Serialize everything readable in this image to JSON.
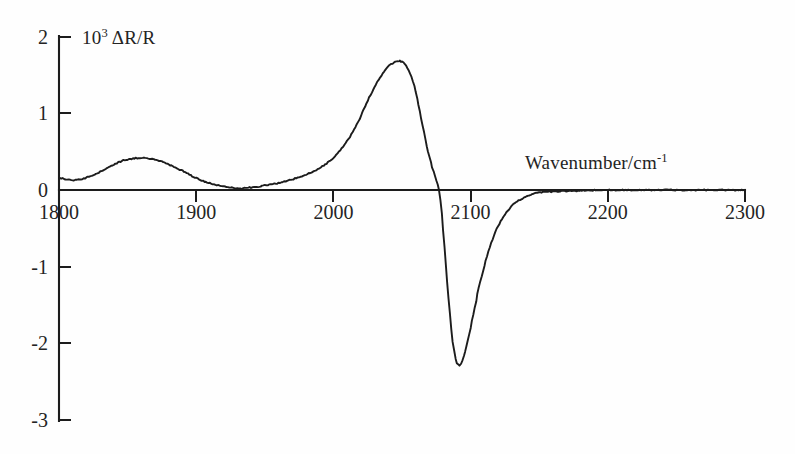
{
  "figure": {
    "background_color": "#fefefe",
    "line_color": "#1c1c1c",
    "axis_color": "#1c1c1c"
  },
  "axis_titles": {
    "y_prefix": "10",
    "y_exponent": "3",
    "y_suffix": " ΔR/R",
    "y_full": "10³ ΔR/R",
    "x_prefix": "Wavenumber/cm",
    "x_exponent": "-1",
    "x_full": "Wavenumber/cm⁻¹"
  },
  "chart_data": {
    "type": "line",
    "title": "",
    "subtitle": "",
    "xlabel": "Wavenumber/cm-1",
    "ylabel": "10^3 ΔR/R",
    "xlim": [
      1800,
      2300
    ],
    "ylim": [
      -3,
      2
    ],
    "xticks": [
      1800,
      1900,
      2000,
      2100,
      2200,
      2300
    ],
    "xtick_labels": [
      "1800",
      "1900",
      "2000",
      "2100",
      "2200",
      "2300"
    ],
    "yticks": [
      2,
      1,
      0,
      -1,
      -2,
      -3
    ],
    "ytick_labels": [
      "2",
      "1",
      "0",
      "-1",
      "-2",
      "-3"
    ],
    "grid": false,
    "legend": false,
    "legend_position": "none",
    "annotations": [],
    "series": [
      {
        "name": "Difference reflectance spectrum",
        "x": [
          1800,
          1806,
          1812,
          1818,
          1824,
          1830,
          1836,
          1842,
          1848,
          1854,
          1860,
          1866,
          1872,
          1878,
          1884,
          1890,
          1896,
          1902,
          1908,
          1914,
          1920,
          1926,
          1932,
          1938,
          1944,
          1950,
          1956,
          1962,
          1968,
          1974,
          1980,
          1986,
          1992,
          1998,
          2004,
          2010,
          2016,
          2021,
          2026,
          2030,
          2034,
          2038,
          2041,
          2044,
          2046,
          2048,
          2049,
          2051,
          2053,
          2055,
          2057,
          2059,
          2061,
          2063,
          2065,
          2067,
          2069,
          2071,
          2073,
          2075,
          2077,
          2079,
          2081,
          2083,
          2085,
          2087,
          2089,
          2091,
          2093,
          2096,
          2099,
          2102,
          2105,
          2108,
          2112,
          2116,
          2120,
          2125,
          2130,
          2135,
          2140,
          2145,
          2150,
          2160,
          2175,
          2200,
          2230,
          2265,
          2300
        ],
        "y": [
          0.16,
          0.14,
          0.13,
          0.15,
          0.19,
          0.24,
          0.3,
          0.35,
          0.39,
          0.41,
          0.42,
          0.41,
          0.39,
          0.35,
          0.3,
          0.25,
          0.19,
          0.14,
          0.1,
          0.07,
          0.05,
          0.03,
          0.02,
          0.03,
          0.04,
          0.06,
          0.08,
          0.1,
          0.13,
          0.16,
          0.2,
          0.25,
          0.31,
          0.39,
          0.5,
          0.64,
          0.82,
          1.0,
          1.2,
          1.34,
          1.47,
          1.57,
          1.63,
          1.66,
          1.675,
          1.68,
          1.68,
          1.66,
          1.62,
          1.56,
          1.47,
          1.35,
          1.2,
          1.02,
          0.84,
          0.66,
          0.5,
          0.36,
          0.24,
          0.12,
          0.0,
          -0.3,
          -0.75,
          -1.2,
          -1.62,
          -1.98,
          -2.2,
          -2.28,
          -2.26,
          -2.1,
          -1.88,
          -1.62,
          -1.36,
          -1.12,
          -0.86,
          -0.64,
          -0.47,
          -0.32,
          -0.21,
          -0.14,
          -0.09,
          -0.05,
          -0.03,
          -0.02,
          -0.01,
          0.0,
          0.0,
          0.0,
          0.0
        ]
      }
    ]
  },
  "ticks": {
    "x": [
      {
        "value": 1800,
        "label": "1800"
      },
      {
        "value": 1900,
        "label": "1900"
      },
      {
        "value": 2000,
        "label": "2000"
      },
      {
        "value": 2100,
        "label": "2100"
      },
      {
        "value": 2200,
        "label": "2200"
      },
      {
        "value": 2300,
        "label": "2300"
      }
    ],
    "y": [
      {
        "value": 2,
        "label": "2"
      },
      {
        "value": 1,
        "label": "1"
      },
      {
        "value": 0,
        "label": "0"
      },
      {
        "value": -1,
        "label": "-1"
      },
      {
        "value": -2,
        "label": "-2"
      },
      {
        "value": -3,
        "label": "-3"
      }
    ]
  }
}
